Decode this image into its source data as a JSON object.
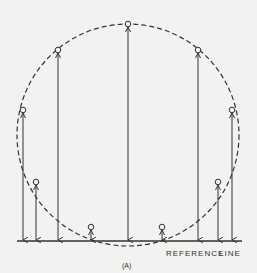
{
  "diagram": {
    "reference_label_1": "REFERENCE",
    "reference_label_2": "LINE",
    "caption": "(A)",
    "colors": {
      "stroke": "#333333",
      "background": "#f2f2f0"
    },
    "circle": {
      "cx": 128,
      "cy": 135,
      "r": 111,
      "style": "dashed"
    },
    "reference_line": {
      "y": 241,
      "x1": 17,
      "x2": 242
    },
    "points": [
      {
        "x": 23,
        "y": 110
      },
      {
        "x": 36,
        "y": 182
      },
      {
        "x": 58,
        "y": 50
      },
      {
        "x": 91,
        "y": 227
      },
      {
        "x": 128,
        "y": 24
      },
      {
        "x": 162,
        "y": 227
      },
      {
        "x": 198,
        "y": 50
      },
      {
        "x": 218,
        "y": 182
      },
      {
        "x": 232,
        "y": 110
      }
    ]
  }
}
